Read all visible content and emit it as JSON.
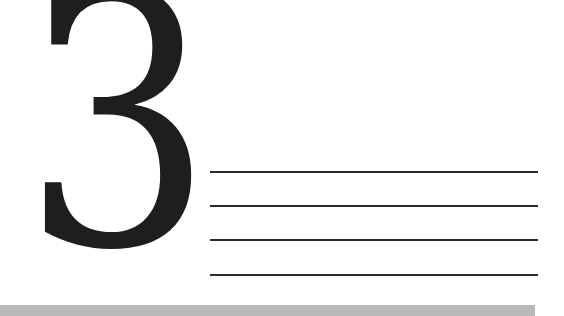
{
  "numeral": {
    "text": "3"
  },
  "lines": {
    "count": 4,
    "color": "#2b2b2b"
  },
  "bar": {
    "color": "#b9b9b9"
  }
}
